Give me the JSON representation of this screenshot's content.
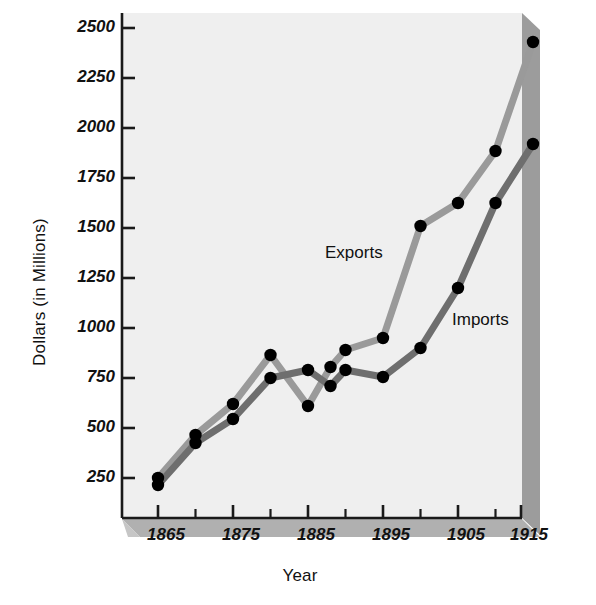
{
  "chart_data": {
    "type": "line",
    "title": "",
    "xlabel": "Year",
    "ylabel": "Dollars (in Millions)",
    "xlim": [
      1863,
      1917
    ],
    "ylim": [
      0,
      2600
    ],
    "xticks": [
      1865,
      1875,
      1885,
      1895,
      1905,
      1915
    ],
    "xtick_labels": [
      "1865",
      "1875",
      "1885",
      "1895",
      "1905",
      "1915"
    ],
    "xminor_ticks": [
      1870,
      1880,
      1890,
      1900,
      1910
    ],
    "yticks": [
      250,
      500,
      750,
      1000,
      1250,
      1500,
      1750,
      2000,
      2250,
      2500
    ],
    "ytick_labels": [
      "250",
      "500",
      "750",
      "1000",
      "1250",
      "1500",
      "1750",
      "2000",
      "2250",
      "2500"
    ],
    "grid": false,
    "legend_position": "inline-annotation",
    "x": [
      1865,
      1870,
      1875,
      1880,
      1885,
      1888,
      1890,
      1895,
      1900,
      1905,
      1910,
      1915
    ],
    "series": [
      {
        "name": "Exports",
        "color": "#9a9a9a",
        "values": [
          250,
          465,
          620,
          865,
          610,
          805,
          890,
          950,
          1510,
          1625,
          1885,
          2430
        ]
      },
      {
        "name": "Imports",
        "color": "#6e6e6e",
        "values": [
          215,
          425,
          545,
          750,
          790,
          710,
          790,
          755,
          900,
          1200,
          1625,
          1920
        ]
      }
    ],
    "annotations": [
      {
        "text": "Exports",
        "x": 1893,
        "y": 1310
      },
      {
        "text": "Imports",
        "x": 1902,
        "y": 1015
      }
    ],
    "marker": "filled-circle",
    "marker_color": "#000000"
  },
  "colors": {
    "plot_background": "#efefef",
    "base_plate": "#b0b0b0",
    "side_shadow": "#9c9c9c",
    "axis": "#1a1a1a",
    "exports_line": "#9a9a9a",
    "imports_line": "#6e6e6e",
    "marker": "#000000",
    "text": "#111111"
  }
}
